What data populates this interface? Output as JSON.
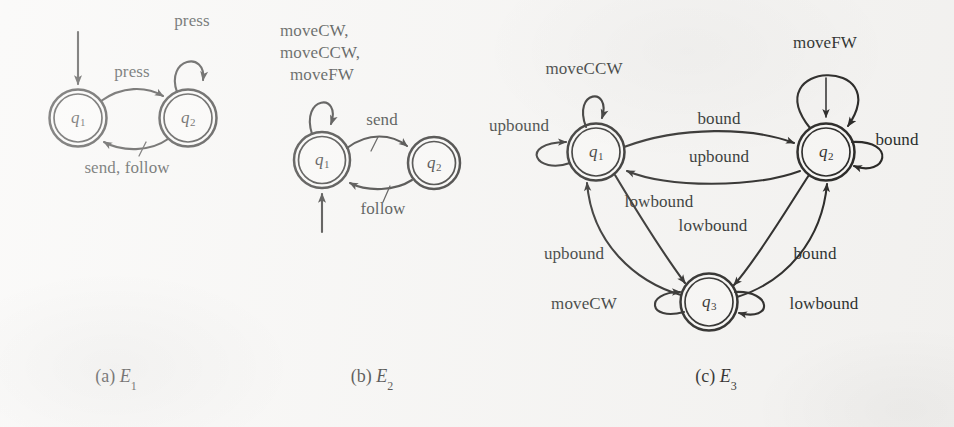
{
  "figure": {
    "background_color": "#f6f5f3",
    "ink_color": "#1d1c1a",
    "panels": [
      {
        "id": "a",
        "caption_prefix": "(a)",
        "caption_name": "E",
        "caption_sub": "1",
        "states": [
          {
            "id": "q1",
            "name": "q",
            "sub": "1",
            "accepting": true,
            "start": true
          },
          {
            "id": "q2",
            "name": "q",
            "sub": "2",
            "accepting": true,
            "start": false
          }
        ],
        "transitions": [
          {
            "from": "q2",
            "to": "q2",
            "label": "press",
            "kind": "self-loop-top"
          },
          {
            "from": "q1",
            "to": "q2",
            "label": "press",
            "kind": "curve-top"
          },
          {
            "from": "q2",
            "to": "q1",
            "label": "send, follow",
            "kind": "curve-bottom"
          }
        ]
      },
      {
        "id": "b",
        "caption_prefix": "(b)",
        "caption_name": "E",
        "caption_sub": "2",
        "states": [
          {
            "id": "q1",
            "name": "q",
            "sub": "1",
            "accepting": true,
            "start": true
          },
          {
            "id": "q2",
            "name": "q",
            "sub": "2",
            "accepting": true,
            "start": false
          }
        ],
        "transitions": [
          {
            "from": "q1",
            "to": "q1",
            "label": "moveCW,\nmoveCCW,\nmoveFW",
            "kind": "self-loop-top"
          },
          {
            "from": "q1",
            "to": "q2",
            "label": "send",
            "kind": "curve-top"
          },
          {
            "from": "q2",
            "to": "q1",
            "label": "follow",
            "kind": "curve-bottom"
          }
        ]
      },
      {
        "id": "c",
        "caption_prefix": "(c)",
        "caption_name": "E",
        "caption_sub": "3",
        "states": [
          {
            "id": "q1",
            "name": "q",
            "sub": "1",
            "accepting": true,
            "start": false
          },
          {
            "id": "q2",
            "name": "q",
            "sub": "2",
            "accepting": true,
            "start": true
          },
          {
            "id": "q3",
            "name": "q",
            "sub": "3",
            "accepting": true,
            "start": false
          }
        ],
        "transitions": [
          {
            "from": "q1",
            "to": "q1",
            "label": "moveCCW",
            "kind": "self-loop-top"
          },
          {
            "from": "q1",
            "to": "q1",
            "label": "upbound",
            "kind": "self-loop-left"
          },
          {
            "from": "q2",
            "to": "q2",
            "label": "moveFW",
            "kind": "self-loop-top-wide"
          },
          {
            "from": "q2",
            "to": "q2",
            "label": "bound",
            "kind": "self-loop-right"
          },
          {
            "from": "q3",
            "to": "q3",
            "label": "moveCW",
            "kind": "self-loop-left"
          },
          {
            "from": "q3",
            "to": "q3",
            "label": "lowbound",
            "kind": "self-loop-right"
          },
          {
            "from": "q1",
            "to": "q2",
            "label": "bound",
            "kind": "curve-top"
          },
          {
            "from": "q2",
            "to": "q1",
            "label": "upbound",
            "kind": "curve-bottom"
          },
          {
            "from": "q1",
            "to": "q3",
            "label": "lowbound",
            "kind": "diagonal"
          },
          {
            "from": "q3",
            "to": "q1",
            "label": "upbound",
            "kind": "diagonal"
          },
          {
            "from": "q2",
            "to": "q3",
            "label": "lowbound",
            "kind": "diagonal"
          },
          {
            "from": "q3",
            "to": "q2",
            "label": "bound",
            "kind": "diagonal"
          }
        ]
      }
    ]
  },
  "labels": {
    "a": {
      "press_self": "press",
      "press_forward": "press",
      "send_follow": "send, follow",
      "q1": "q",
      "q1sub": "1",
      "q2": "q",
      "q2sub": "2",
      "caption_prefix": "(a)",
      "caption_name": "E",
      "caption_sub": "1"
    },
    "b": {
      "self_line1": "moveCW,",
      "self_line2": "moveCCW,",
      "self_line3": "moveFW",
      "send": "send",
      "follow": "follow",
      "q1": "q",
      "q1sub": "1",
      "q2": "q",
      "q2sub": "2",
      "caption_prefix": "(b)",
      "caption_name": "E",
      "caption_sub": "2"
    },
    "c": {
      "moveccw": "moveCCW",
      "upbound_left": "upbound",
      "movefw": "moveFW",
      "bound_right": "bound",
      "bound_top": "bound",
      "upbound_mid": "upbound",
      "lowbound_left": "lowbound",
      "lowbound_right": "lowbound",
      "upbound_lower_left": "upbound",
      "bound_lower_right": "bound",
      "movecw": "moveCW",
      "lowbound_q3": "lowbound",
      "q1": "q",
      "q1sub": "1",
      "q2": "q",
      "q2sub": "2",
      "q3": "q",
      "q3sub": "3",
      "caption_prefix": "(c)",
      "caption_name": "E",
      "caption_sub": "3"
    }
  }
}
